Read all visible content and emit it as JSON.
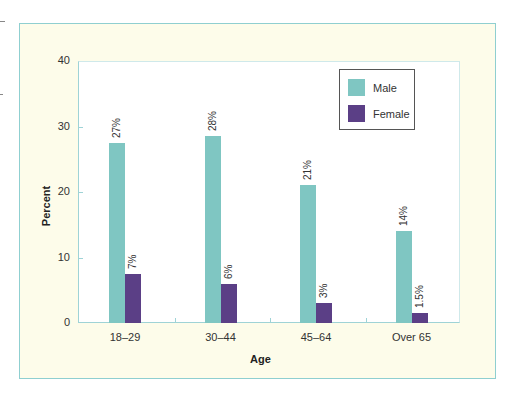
{
  "chart_data": {
    "type": "bar",
    "title": "",
    "xlabel": "Age",
    "ylabel": "Percent",
    "ylim": [
      0,
      40
    ],
    "yticks": [
      0,
      10,
      20,
      30,
      40
    ],
    "categories": [
      "18–29",
      "30–44",
      "45–64",
      "Over 65"
    ],
    "series": [
      {
        "name": "Male",
        "color": "#7fc6c2",
        "values": [
          27.5,
          28.5,
          21,
          14
        ],
        "labels": [
          "27%",
          "28%",
          "21%",
          "14%"
        ]
      },
      {
        "name": "Female",
        "color": "#5b3f86",
        "values": [
          7.5,
          6,
          3,
          1.5
        ],
        "labels": [
          "7%",
          "6%",
          "3%",
          "1.5%"
        ]
      }
    ],
    "grid": false,
    "legend_position": "upper right"
  },
  "axes": {
    "x_title": "Age",
    "y_title": "Percent",
    "y_tick_labels": [
      "0",
      "10",
      "20",
      "30",
      "40"
    ]
  },
  "legend": {
    "items": [
      {
        "label": "Male",
        "color": "#7fc6c2"
      },
      {
        "label": "Female",
        "color": "#5b3f86"
      }
    ]
  },
  "colors": {
    "frame_border": "#8fcfd0",
    "frame_fill": "#fdfcea",
    "plot_fill": "#ffffff"
  }
}
